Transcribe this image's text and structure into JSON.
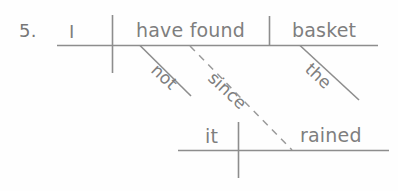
{
  "exercise": {
    "number": "5.",
    "type": "reed-kellogg-sentence-diagram",
    "sentence": "I have not found the basket since it rained"
  },
  "colors": {
    "ink": "#7e7e7e",
    "line": "#8d8d8d",
    "background": "#fefefe"
  },
  "main_clause": {
    "subject": "I",
    "verb": "have found",
    "direct_object": "basket",
    "modifiers": {
      "adverb": "not",
      "article": "the"
    }
  },
  "subordinate_clause": {
    "conjunction": "since",
    "subject": "it",
    "verb": "rained"
  },
  "labels": {
    "number": "5.",
    "subject": "I",
    "verb": "have found",
    "object": "basket",
    "article": "the",
    "adverb": "not",
    "conjunction": "since",
    "sub_subject": "it",
    "sub_verb": "rained"
  }
}
